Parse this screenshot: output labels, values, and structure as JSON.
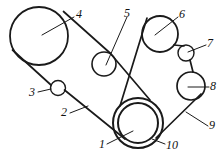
{
  "figure": {
    "kind": "belt-drive-pulley-schematic",
    "background_color": "#ffffff",
    "stroke_color": "#1a1a1a",
    "width": 224,
    "height": 160
  },
  "pulleys": [
    {
      "id": "1",
      "name": "inner-drive-pulley",
      "cx": 138,
      "cy": 123,
      "r": 20,
      "stroke_width": 2.0
    },
    {
      "id": "10",
      "name": "outer-drive-pulley",
      "cx": 138,
      "cy": 123,
      "r": 25,
      "stroke_width": 2.0
    },
    {
      "id": "4",
      "name": "large-upper-left-pulley",
      "cx": 39,
      "cy": 36,
      "r": 29,
      "stroke_width": 1.8
    },
    {
      "id": "3",
      "name": "small-idler-lower-left",
      "cx": 58,
      "cy": 88,
      "r": 7.5,
      "stroke_width": 1.4
    },
    {
      "id": "5",
      "name": "mid-tensioner-pulley",
      "cx": 104,
      "cy": 64,
      "r": 12,
      "stroke_width": 1.6
    },
    {
      "id": "6",
      "name": "upper-right-pulley",
      "cx": 160,
      "cy": 34,
      "r": 18,
      "stroke_width": 1.8
    },
    {
      "id": "7",
      "name": "small-idler-upper-right",
      "cx": 186,
      "cy": 53,
      "r": 8,
      "stroke_width": 1.4
    },
    {
      "id": "8",
      "name": "right-pulley",
      "cx": 191,
      "cy": 86,
      "r": 14,
      "stroke_width": 1.7
    }
  ],
  "belts": [
    {
      "id": "2",
      "name": "main-belt-left-loop",
      "stroke_width": 1.6,
      "path": "M 64 9 L 120 88 M 10 44 L 128 148 M 58 80.5 L 58 80.5"
    },
    {
      "id": "9",
      "name": "main-belt-right-loop",
      "stroke_width": 1.6,
      "path": "M 147 17 L 120 104"
    }
  ],
  "belt_segments": [
    {
      "name": "belt-seg-pulley4-to-pulley5-upper",
      "d": "M 63.5 11.5 L 110 53"
    },
    {
      "name": "belt-seg-pulley5-to-drive",
      "d": "M 110 53 L 150 100"
    },
    {
      "name": "belt-seg-pulley4-to-idler3-lower",
      "d": "M 12.5 50 L 51 85"
    },
    {
      "name": "belt-seg-idler3-to-drive-lower",
      "d": "M 64.5 90 L 125 139"
    },
    {
      "name": "belt-seg-drive-to-pulley6-left",
      "d": "M 120 106 L 147 18"
    },
    {
      "name": "belt-seg-pulley6-to-pulley7",
      "d": "M 174 45 L 184 46"
    },
    {
      "name": "belt-seg-pulley7-to-pulley8",
      "d": "M 190 60 L 193 72"
    },
    {
      "name": "belt-seg-pulley8-to-drive-right",
      "d": "M 201 94 L 156 138"
    }
  ],
  "callouts": [
    {
      "id": "4",
      "name": "callout-4",
      "label": "4",
      "label_x": 76,
      "label_y": 8,
      "line": {
        "x1": 74,
        "y1": 17,
        "x2": 42,
        "y2": 35
      }
    },
    {
      "id": "5",
      "name": "callout-5",
      "label": "5",
      "label_x": 124,
      "label_y": 7,
      "line": {
        "x1": 127,
        "y1": 17,
        "x2": 106,
        "y2": 65
      }
    },
    {
      "id": "6",
      "name": "callout-6",
      "label": "6",
      "label_x": 179,
      "label_y": 8,
      "line": {
        "x1": 178,
        "y1": 17,
        "x2": 155,
        "y2": 35
      }
    },
    {
      "id": "7",
      "name": "callout-7",
      "label": "7",
      "label_x": 207,
      "label_y": 37,
      "line": {
        "x1": 206,
        "y1": 45,
        "x2": 188,
        "y2": 52
      }
    },
    {
      "id": "8",
      "name": "callout-8",
      "label": "8",
      "label_x": 210,
      "label_y": 80,
      "line": {
        "x1": 209,
        "y1": 87,
        "x2": 188,
        "y2": 87
      }
    },
    {
      "id": "9",
      "name": "callout-9",
      "label": "9",
      "label_x": 209,
      "label_y": 119,
      "line": {
        "x1": 208,
        "y1": 126,
        "x2": 186,
        "y2": 112
      }
    },
    {
      "id": "10",
      "name": "callout-10",
      "label": "10",
      "label_x": 166,
      "label_y": 139,
      "line": {
        "x1": 165,
        "y1": 144,
        "x2": 152,
        "y2": 139
      }
    },
    {
      "id": "1",
      "name": "callout-1",
      "label": "1",
      "label_x": 99,
      "label_y": 138,
      "line": {
        "x1": 107,
        "y1": 144,
        "x2": 133,
        "y2": 131
      }
    },
    {
      "id": "2",
      "name": "callout-2",
      "label": "2",
      "label_x": 61,
      "label_y": 106,
      "line": {
        "x1": 70,
        "y1": 113,
        "x2": 88,
        "y2": 106
      }
    },
    {
      "id": "3",
      "name": "callout-3",
      "label": "3",
      "label_x": 29,
      "label_y": 86,
      "line": {
        "x1": 38,
        "y1": 92,
        "x2": 51,
        "y2": 89
      }
    }
  ]
}
